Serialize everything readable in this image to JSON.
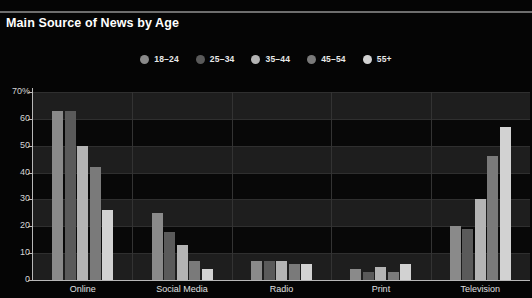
{
  "chart_title": "Main Source of News by Age",
  "theme": {
    "page_background": "#050505",
    "plot_background": "#191919",
    "axis_color": "#b8b8b8",
    "grid_color": "#2f2f2f",
    "text_color": "#ffffff"
  },
  "legend": {
    "position": "top-center",
    "items": [
      {
        "label": "18–24",
        "color": "#8a8a8a"
      },
      {
        "label": "25–34",
        "color": "#5a5a5a"
      },
      {
        "label": "35–44",
        "color": "#b4b4b4"
      },
      {
        "label": "45–54",
        "color": "#7a7a7a"
      },
      {
        "label": "55+",
        "color": "#d2d2d2"
      }
    ]
  },
  "chart_data": {
    "type": "bar",
    "title": "Main Source of News by Age",
    "xlabel": "",
    "ylabel": "70%",
    "ylim": [
      0,
      70
    ],
    "ytick_labels": [
      "70%",
      "60",
      "50",
      "40",
      "30",
      "20",
      "10",
      "0"
    ],
    "ytick_values": [
      70,
      60,
      50,
      40,
      30,
      20,
      10,
      0
    ],
    "grid": true,
    "grid_axis": "y",
    "categories": [
      "Online",
      "Social Media",
      "Radio",
      "Print",
      "Television"
    ],
    "series": [
      {
        "name": "18–24",
        "color": "#8a8a8a",
        "values": [
          63,
          25,
          7,
          4,
          20
        ]
      },
      {
        "name": "25–34",
        "color": "#5a5a5a",
        "values": [
          63,
          18,
          7,
          3,
          19
        ]
      },
      {
        "name": "35–44",
        "color": "#b4b4b4",
        "values": [
          50,
          13,
          7,
          5,
          30
        ]
      },
      {
        "name": "45–54",
        "color": "#7a7a7a",
        "values": [
          42,
          7,
          6,
          3,
          46
        ]
      },
      {
        "name": "55+",
        "color": "#d2d2d2",
        "values": [
          26,
          4,
          6,
          6,
          57
        ]
      }
    ]
  }
}
